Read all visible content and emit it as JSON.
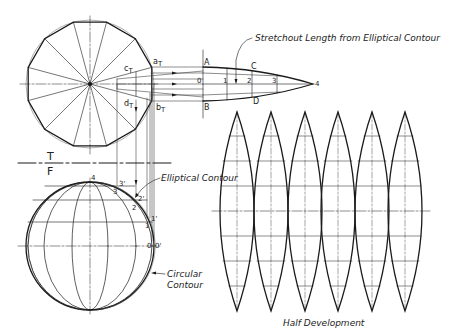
{
  "labels": {
    "stretchout": "Stretchout Length from Elliptical Contour",
    "elliptical": "Elliptical Contour",
    "circular_line1": "Circular",
    "circular_line2": "Contour",
    "half_dev": "Half Development",
    "plane_top": "T",
    "plane_front": "F",
    "a_t": "a",
    "b_t": "b",
    "c_t": "c",
    "d_t": "d",
    "sub_t": "T",
    "A": "A",
    "B": "B",
    "C": "C",
    "D": "D",
    "s0": "0",
    "s1": "1",
    "s2": "2",
    "s3": "3",
    "s4": "4",
    "f4": "4",
    "f3p": "3'",
    "f3": "3",
    "f2p": "2'",
    "f2": "2",
    "f1p": "1'",
    "f1": "1",
    "f0": "0",
    "f0p": "0'"
  },
  "views": {
    "top_view": {
      "shape": "12-sided polygon inscribed in circle",
      "center": [
        90,
        84
      ],
      "radius": 64
    },
    "front_view": {
      "shape": "circle with meridian ellipses",
      "center": [
        90,
        246
      ],
      "radius": 64
    },
    "development": {
      "gore_count": 6,
      "gore_centers_x": [
        237,
        271,
        305,
        338,
        372,
        405
      ],
      "top_y": 112,
      "bottom_y": 311,
      "half_width": 17
    }
  },
  "colors": {
    "line": "#1a1a1a",
    "thin": "#555555",
    "background": "#ffffff"
  }
}
